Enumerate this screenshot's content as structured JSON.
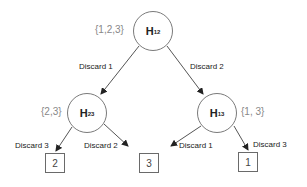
{
  "diagram": {
    "type": "tree",
    "colors": {
      "line": "#555555",
      "node_border": "#7a7a7a",
      "set_label": "#888888",
      "text": "#222222"
    },
    "root": {
      "id": "H12",
      "label_main": "H",
      "label_sub": "12",
      "set": "{1,2,3}"
    },
    "internal": [
      {
        "id": "H23",
        "label_main": "H",
        "label_sub": "23",
        "set": "{2,3}"
      },
      {
        "id": "H13",
        "label_main": "H",
        "label_sub": "13",
        "set": "{1, 3}"
      }
    ],
    "edges": [
      {
        "from": "H12",
        "to": "H23",
        "label": "Discard 1"
      },
      {
        "from": "H12",
        "to": "H13",
        "label": "Discard 2"
      },
      {
        "from": "H23",
        "to": "leaf-2",
        "label": "Discard 3"
      },
      {
        "from": "H23",
        "to": "leaf-3",
        "label": "Discard 2"
      },
      {
        "from": "H13",
        "to": "leaf-3",
        "label": "Discard 1"
      },
      {
        "from": "H13",
        "to": "leaf-1",
        "label": "Discard 3"
      }
    ],
    "leaves": [
      {
        "id": "leaf-2",
        "value": "2"
      },
      {
        "id": "leaf-3",
        "value": "3"
      },
      {
        "id": "leaf-1",
        "value": "1"
      }
    ]
  }
}
